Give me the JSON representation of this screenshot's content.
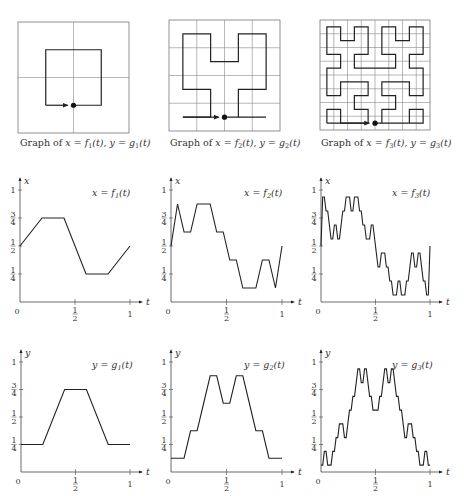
{
  "figure": {
    "top_row": [
      {
        "order": 1,
        "caption_prefix": "Graph of ",
        "caption": "x = f1(t), y = g1(t)",
        "grid_divisions": 2
      },
      {
        "order": 2,
        "caption_prefix": "Graph of ",
        "caption": "x = f2(t), y = g2(t)",
        "grid_divisions": 4
      },
      {
        "order": 3,
        "caption_prefix": "Graph of ",
        "caption": "x = f3(t), y = g3(t)",
        "grid_divisions": 8
      }
    ],
    "x_row": [
      {
        "order": 1,
        "title": "x = f1(t)",
        "axis_label": "x"
      },
      {
        "order": 2,
        "title": "x = f2(t)",
        "axis_label": "x"
      },
      {
        "order": 3,
        "title": "x = f3(t)",
        "axis_label": "x"
      }
    ],
    "y_row": [
      {
        "order": 1,
        "title": "y = g1(t)",
        "axis_label": "y"
      },
      {
        "order": 2,
        "title": "y = g2(t)",
        "axis_label": "y"
      },
      {
        "order": 3,
        "title": "y = g3(t)",
        "axis_label": "y"
      }
    ],
    "tick_labels": {
      "y_ticks": [
        "1/4",
        "1/2",
        "3/4",
        "1"
      ],
      "t_ticks": [
        "0",
        "1/2",
        "1"
      ],
      "t_axis": "t"
    }
  },
  "chart_data": [
    {
      "type": "line",
      "title": "Graph of x = f1(t), y = g1(t)",
      "description": "Order-1 Hilbert curve polygon on 2x2 grid, start at bottom-centre (dot), ending with arrow",
      "xlim": [
        0,
        1
      ],
      "ylim": [
        0,
        1
      ]
    },
    {
      "type": "line",
      "title": "Graph of x = f2(t), y = g2(t)",
      "description": "Order-2 Hilbert curve polygon on 4x4 grid",
      "xlim": [
        0,
        1
      ],
      "ylim": [
        0,
        1
      ]
    },
    {
      "type": "line",
      "title": "Graph of x = f3(t), y = g3(t)",
      "description": "Order-3 Hilbert curve polygon on 8x8 grid",
      "xlim": [
        0,
        1
      ],
      "ylim": [
        0,
        1
      ]
    },
    {
      "type": "line",
      "title": "x = f1(t)",
      "xlabel": "t",
      "ylabel": "x",
      "x": [
        0,
        0.125,
        0.375,
        0.625,
        0.875,
        1
      ],
      "values": [
        0.5,
        0.75,
        0.75,
        0.25,
        0.25,
        0.5
      ],
      "xlim": [
        0,
        1
      ],
      "ylim": [
        0,
        1
      ]
    },
    {
      "type": "line",
      "title": "x = f2(t)",
      "xlabel": "t",
      "ylabel": "x",
      "description": "piecewise linear x-coordinate of order-2 Hilbert polygon",
      "xlim": [
        0,
        1
      ],
      "ylim": [
        0,
        1
      ]
    },
    {
      "type": "line",
      "title": "x = f3(t)",
      "xlabel": "t",
      "ylabel": "x",
      "description": "piecewise linear x-coordinate of order-3 Hilbert polygon",
      "xlim": [
        0,
        1
      ],
      "ylim": [
        0,
        1
      ]
    },
    {
      "type": "line",
      "title": "y = g1(t)",
      "xlabel": "t",
      "ylabel": "y",
      "x": [
        0,
        0.125,
        0.375,
        0.625,
        0.875,
        1
      ],
      "values": [
        0.25,
        0.25,
        0.75,
        0.75,
        0.25,
        0.25
      ],
      "xlim": [
        0,
        1
      ],
      "ylim": [
        0,
        1
      ]
    },
    {
      "type": "line",
      "title": "y = g2(t)",
      "xlabel": "t",
      "ylabel": "y",
      "description": "piecewise linear y-coordinate of order-2 Hilbert polygon",
      "xlim": [
        0,
        1
      ],
      "ylim": [
        0,
        1
      ]
    },
    {
      "type": "line",
      "title": "y = g3(t)",
      "xlabel": "t",
      "ylabel": "y",
      "description": "piecewise linear y-coordinate of order-3 Hilbert polygon",
      "xlim": [
        0,
        1
      ],
      "ylim": [
        0,
        1
      ]
    }
  ]
}
